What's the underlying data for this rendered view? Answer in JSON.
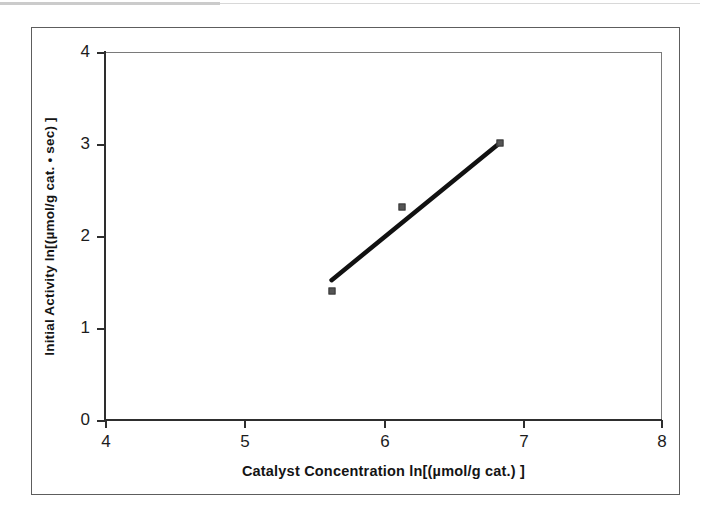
{
  "chart_data": {
    "type": "scatter",
    "title": "",
    "xlabel": "Catalyst Concentration  ln[(µmol/g cat.) ]",
    "ylabel": "Initial Activity  ln[(µmol/g cat. • sec) ]",
    "xlim": [
      4,
      8
    ],
    "ylim": [
      0,
      4
    ],
    "xticks": [
      "4",
      "5",
      "6",
      "7",
      "8"
    ],
    "yticks": [
      "0",
      "1",
      "2",
      "3",
      "4"
    ],
    "grid": false,
    "legend": "none",
    "series": [
      {
        "name": "Initial Activity vs Catalyst Concentration",
        "marker": "square",
        "marker_color": "#555555",
        "x": [
          5.63,
          6.14,
          6.84
        ],
        "y": [
          1.4,
          2.32,
          3.01
        ]
      }
    ],
    "trendline": {
      "name": "linear fit",
      "color": "#111111",
      "x": [
        5.63,
        6.84
      ],
      "y": [
        1.52,
        3.01
      ]
    }
  },
  "axes": {
    "x_title": "Catalyst Concentration  ln[(µmol/g cat.) ]",
    "y_title": "Initial Activity  ln[(µmol/g cat. • sec) ]",
    "x_tick_labels": [
      "4",
      "5",
      "6",
      "7",
      "8"
    ],
    "y_tick_labels": [
      "0",
      "1",
      "2",
      "3",
      "4"
    ]
  },
  "colors": {
    "marker": "#555555",
    "line": "#111111",
    "axis": "#2e2e2e",
    "frame": "#5d5d5d",
    "background": "#ffffff"
  }
}
